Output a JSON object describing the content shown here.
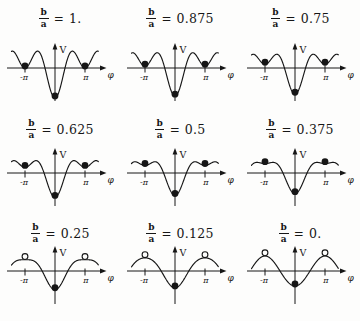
{
  "figure": {
    "fraction_numerator": "b",
    "fraction_denominator": "a",
    "equals": "=",
    "x_axis_label": "φ",
    "y_axis_label": "V",
    "neg_pi_tick": "-π",
    "pos_pi_tick": "π",
    "ink_color": "#161616",
    "marker_legend": {
      "filled-circle": "stable equilibrium",
      "open-circle": "unstable equilibrium"
    }
  },
  "chart_data": {
    "type": "line",
    "formula": "V(φ) = -a·cos φ - b·cos 2φ, with a = 1",
    "xlabel": "φ",
    "ylabel": "V",
    "x_ticks": [
      "-π",
      "π"
    ],
    "x_range_in_pi": [
      -1.45,
      1.45
    ],
    "grid": false,
    "panels": [
      {
        "ratio": 1.0,
        "ratio_label": "1.",
        "V_at_0": -2.0,
        "V_at_pi": 0.0,
        "side_marker": "filled",
        "equilibria": [
          {
            "phi": "0",
            "stability": "stable"
          },
          {
            "phi": "±π",
            "stability": "stable"
          }
        ]
      },
      {
        "ratio": 0.875,
        "ratio_label": "0.875",
        "V_at_0": -1.875,
        "V_at_pi": 0.125,
        "side_marker": "filled",
        "equilibria": [
          {
            "phi": "0",
            "stability": "stable"
          },
          {
            "phi": "±π",
            "stability": "stable"
          }
        ]
      },
      {
        "ratio": 0.75,
        "ratio_label": "0.75",
        "V_at_0": -1.75,
        "V_at_pi": 0.25,
        "side_marker": "filled",
        "equilibria": [
          {
            "phi": "0",
            "stability": "stable"
          },
          {
            "phi": "±π",
            "stability": "stable"
          }
        ]
      },
      {
        "ratio": 0.625,
        "ratio_label": "0.625",
        "V_at_0": -1.625,
        "V_at_pi": 0.375,
        "side_marker": "filled",
        "equilibria": [
          {
            "phi": "0",
            "stability": "stable"
          },
          {
            "phi": "±π",
            "stability": "stable"
          }
        ]
      },
      {
        "ratio": 0.5,
        "ratio_label": "0.5",
        "V_at_0": -1.5,
        "V_at_pi": 0.5,
        "side_marker": "filled",
        "equilibria": [
          {
            "phi": "0",
            "stability": "stable"
          },
          {
            "phi": "±π",
            "stability": "stable"
          }
        ]
      },
      {
        "ratio": 0.375,
        "ratio_label": "0.375",
        "V_at_0": -1.375,
        "V_at_pi": 0.625,
        "side_marker": "filled",
        "equilibria": [
          {
            "phi": "0",
            "stability": "stable"
          },
          {
            "phi": "±π",
            "stability": "stable"
          }
        ]
      },
      {
        "ratio": 0.25,
        "ratio_label": "0.25",
        "V_at_0": -1.25,
        "V_at_pi": 0.75,
        "side_marker": "open",
        "equilibria": [
          {
            "phi": "0",
            "stability": "stable"
          },
          {
            "phi": "±π",
            "stability": "unstable"
          }
        ]
      },
      {
        "ratio": 0.125,
        "ratio_label": "0.125",
        "V_at_0": -1.125,
        "V_at_pi": 0.875,
        "side_marker": "open",
        "equilibria": [
          {
            "phi": "0",
            "stability": "stable"
          },
          {
            "phi": "±π",
            "stability": "unstable"
          }
        ]
      },
      {
        "ratio": 0.0,
        "ratio_label": "0.",
        "V_at_0": -1.0,
        "V_at_pi": 1.0,
        "side_marker": "open",
        "equilibria": [
          {
            "phi": "0",
            "stability": "stable"
          },
          {
            "phi": "±π",
            "stability": "unstable"
          }
        ]
      }
    ]
  }
}
